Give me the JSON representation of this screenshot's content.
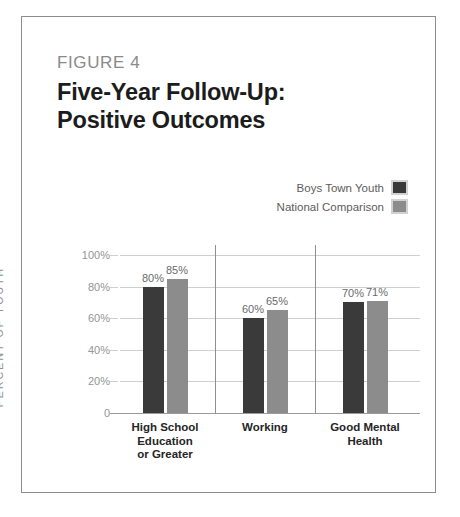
{
  "figure": {
    "label": "FIGURE 4",
    "title_line1": "Five-Year Follow-Up:",
    "title_line2": "Positive Outcomes"
  },
  "legend": {
    "items": [
      {
        "label": "Boys Town Youth",
        "color": "#3a3a3a"
      },
      {
        "label": "National Comparison",
        "color": "#8c8c8c"
      }
    ]
  },
  "axis": {
    "y_title": "PERCENT OF YOUTH",
    "y_ticks": [
      "100%",
      "80%",
      "60%",
      "40%",
      "20%",
      "0"
    ]
  },
  "chart_data": {
    "type": "bar",
    "title": "Five-Year Follow-Up: Positive Outcomes",
    "xlabel": "",
    "ylabel": "PERCENT OF YOUTH",
    "ylim": [
      0,
      100
    ],
    "ytick_values": [
      0,
      20,
      40,
      60,
      80,
      100
    ],
    "ytick_labels": [
      "0",
      "20%",
      "40%",
      "60%",
      "80%",
      "100%"
    ],
    "grid": true,
    "legend_position": "top-right",
    "categories": [
      "High School Education or Greater",
      "Working",
      "Good Mental Health"
    ],
    "category_lines": [
      [
        "High School",
        "Education",
        "or Greater"
      ],
      [
        "Working"
      ],
      [
        "Good Mental",
        "Health"
      ]
    ],
    "series": [
      {
        "name": "Boys Town Youth",
        "color": "#3a3a3a",
        "values": [
          80,
          60,
          70
        ],
        "labels": [
          "80%",
          "60%",
          "70%"
        ]
      },
      {
        "name": "National Comparison",
        "color": "#8c8c8c",
        "values": [
          85,
          65,
          71
        ],
        "labels": [
          "85%",
          "65%",
          "71%"
        ]
      }
    ]
  }
}
